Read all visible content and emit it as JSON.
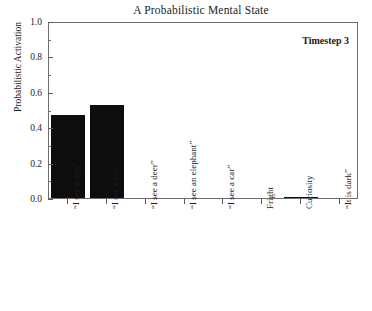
{
  "chart_data": {
    "type": "bar",
    "title": "A Probabilistic Mental State",
    "xlabel": "",
    "ylabel": "Probabilistic Activation",
    "ylim": [
      0.0,
      1.0
    ],
    "ytick_labels": [
      "0.0",
      "0.2",
      "0.4",
      "0.6",
      "0.8",
      "1.0"
    ],
    "ytick_values": [
      0.0,
      0.2,
      0.4,
      0.6,
      0.8,
      1.0
    ],
    "yminor_values": [
      0.1,
      0.3,
      0.5,
      0.7,
      0.9
    ],
    "grid": false,
    "legend": "none",
    "annotation": "Timestep 3",
    "categories": [
      "“I see a dog”",
      "“I see a cat”",
      "“I see a deer”",
      "“I see an elephant”",
      "“I see a car”",
      "Fright",
      "Curiosity",
      "“It is dark”"
    ],
    "values": [
      0.47,
      0.525,
      0.0,
      0.0,
      0.0,
      0.0,
      0.005,
      0.0
    ],
    "bar_color": "#0d0d0d"
  }
}
